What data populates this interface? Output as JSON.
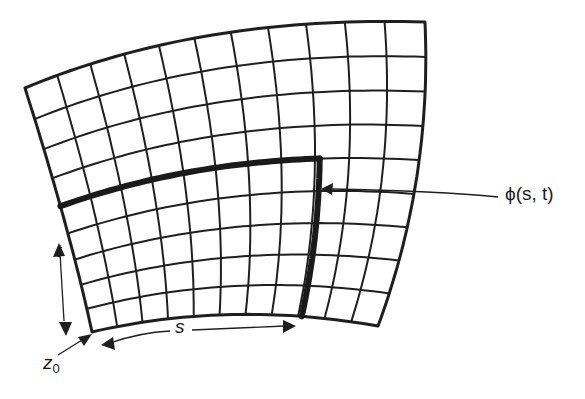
{
  "figure": {
    "type": "parametric-surface-grid",
    "stroke_color": "#1f1f1f",
    "background": "#ffffff",
    "grid": {
      "columns": 11,
      "rows": 9,
      "corners": {
        "top_left": [
          25,
          88
        ],
        "top_right": [
          425,
          22
        ],
        "bottom_right": [
          378,
          326
        ],
        "bottom_left": [
          92,
          332
        ]
      },
      "bold_row_fraction_from_bottom": 0.556,
      "bold_col_fraction": 0.74
    },
    "labels": {
      "point": "ϕ(s, t)",
      "s_axis": "s",
      "t_axis": "t",
      "origin": "z",
      "origin_sub": "0"
    }
  }
}
